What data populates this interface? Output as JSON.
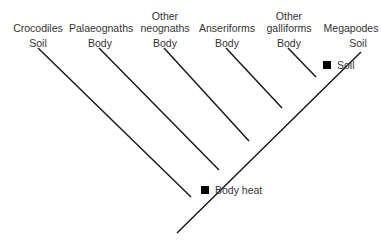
{
  "taxa": [
    {
      "name_line1": "",
      "name_line2": "Crocodiles",
      "trait": "Soil"
    },
    {
      "name_line1": "",
      "name_line2": "Palaeognaths",
      "trait": "Body"
    },
    {
      "name_line1": "Other",
      "name_line2": "neognaths",
      "trait": "Body"
    },
    {
      "name_line1": "",
      "name_line2": "Anseriforms",
      "trait": "Body"
    },
    {
      "name_line1": "Other",
      "name_line2": "galliforms",
      "trait": "Body"
    },
    {
      "name_line1": "",
      "name_line2": "Megapodes",
      "trait": "Soil"
    }
  ],
  "markers": [
    {
      "label": "Body heat"
    },
    {
      "label": "Soil"
    }
  ],
  "colors": {
    "line": "#1a1a1a",
    "marker": "#000000",
    "text": "#333333"
  }
}
